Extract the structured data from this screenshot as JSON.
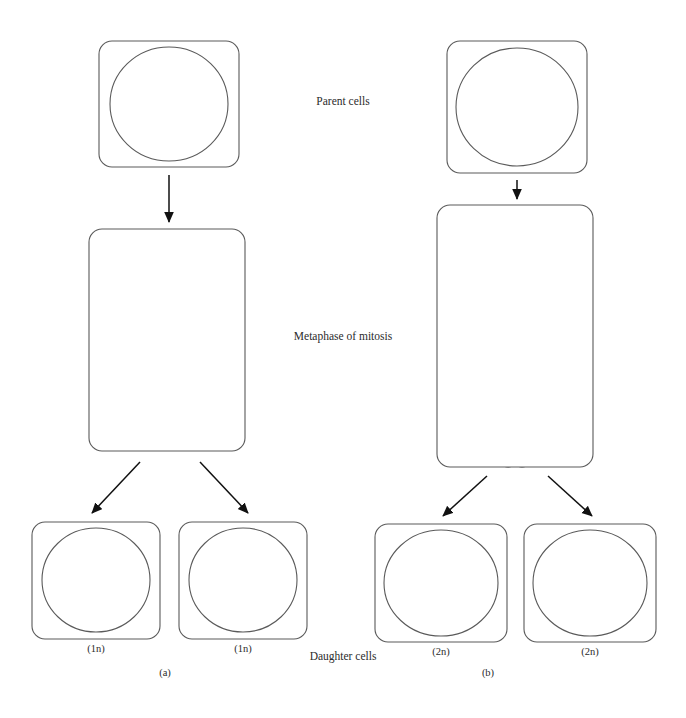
{
  "figure": {
    "title_stage_parent": "Parent cells",
    "title_stage_metaphase": "Metaphase of mitosis",
    "title_stage_daughter": "Daughter cells",
    "panel_a_label": "(a)",
    "panel_b_label": "(b)"
  },
  "colors": {
    "chromatid_light": "#d2d2d2",
    "chromatid_dark": "#9a9a9a",
    "strand": "#0d0d0d",
    "outline": "#4a4a4a",
    "spindle": "#5a5a5a",
    "arrow": "#111111",
    "background": "#ffffff"
  },
  "gene_labels": {
    "a": "A",
    "b": "B",
    "p": "P",
    "q": "Q"
  },
  "panels": [
    {
      "id": "a",
      "label": "(a)",
      "parent_cell": {
        "ploidy": "",
        "chromosomes": [
          {
            "genes": [
              "A",
              "B"
            ],
            "shade": "light",
            "length": "short"
          },
          {
            "genes": [
              "P",
              "Q"
            ],
            "shade": "light",
            "length": "long"
          }
        ]
      },
      "metaphase": {
        "chromosomes": [
          {
            "genes": [
              "B",
              "A"
            ],
            "shade": "light",
            "form": "vertical-pair"
          },
          {
            "genes": [
              "Q",
              "P"
            ],
            "shade": "light",
            "form": "x-cross"
          }
        ]
      },
      "daughter_cells": [
        {
          "ploidy": "(1n)",
          "chromosomes": [
            {
              "genes": [
                "A",
                "B"
              ],
              "shade": "light",
              "length": "short"
            },
            {
              "genes": [
                "P",
                "Q"
              ],
              "shade": "light",
              "length": "long"
            }
          ]
        },
        {
          "ploidy": "(1n)",
          "chromosomes": [
            {
              "genes": [
                "A",
                "B"
              ],
              "shade": "light",
              "length": "short"
            },
            {
              "genes": [
                "P",
                "Q"
              ],
              "shade": "light",
              "length": "long"
            }
          ]
        }
      ]
    },
    {
      "id": "b",
      "label": "(b)",
      "parent_cell": {
        "ploidy": "",
        "chromosomes": [
          {
            "genes": [
              "A",
              "B"
            ],
            "shade": "light",
            "length": "short"
          },
          {
            "genes": [
              "P",
              "Q"
            ],
            "shade": "light",
            "length": "long"
          },
          {
            "genes": [
              "P",
              "Q"
            ],
            "shade": "dark",
            "length": "long"
          },
          {
            "genes": [
              "A",
              "B"
            ],
            "shade": "dark",
            "length": "short"
          }
        ]
      },
      "metaphase": {
        "chromosomes": [
          {
            "genes": [
              "B",
              "A"
            ],
            "shade": "light",
            "form": "vertical-pair"
          },
          {
            "genes": [
              "Q",
              "P"
            ],
            "shade": "light",
            "form": "x-cross"
          },
          {
            "genes": [
              "Q",
              "P"
            ],
            "shade": "dark",
            "form": "x-cross"
          },
          {
            "genes": [
              "A",
              "B"
            ],
            "shade": "dark",
            "form": "vertical-pair"
          }
        ]
      },
      "daughter_cells": [
        {
          "ploidy": "(2n)",
          "chromosomes": [
            {
              "genes": [
                "A",
                "B"
              ],
              "shade": "light",
              "length": "short"
            },
            {
              "genes": [
                "P",
                "Q"
              ],
              "shade": "dark",
              "length": "long"
            },
            {
              "genes": [
                "P",
                "Q"
              ],
              "shade": "light",
              "length": "long"
            },
            {
              "genes": [
                "A",
                "B"
              ],
              "shade": "dark",
              "length": "short"
            }
          ]
        },
        {
          "ploidy": "(2n)",
          "chromosomes": [
            {
              "genes": [
                "A",
                "B"
              ],
              "shade": "light",
              "length": "short"
            },
            {
              "genes": [
                "P",
                "Q"
              ],
              "shade": "light",
              "length": "long"
            },
            {
              "genes": [
                "P",
                "Q"
              ],
              "shade": "dark",
              "length": "long"
            },
            {
              "genes": [
                "A",
                "B"
              ],
              "shade": "dark",
              "length": "short"
            }
          ]
        }
      ]
    }
  ]
}
